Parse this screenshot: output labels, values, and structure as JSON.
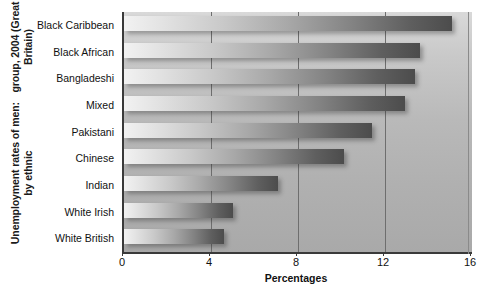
{
  "chart_data": {
    "type": "bar",
    "orientation": "horizontal",
    "title": "Unemployment rates of men: by ethnic group, 2004 (Great Britain)",
    "title_lines": [
      "Unemployment rates of men: by ethnic",
      "group, 2004 (Great Britain)"
    ],
    "xlabel": "Percentages",
    "ylabel": "",
    "categories": [
      "Black Caribbean",
      "Black African",
      "Bangladeshi",
      "Mixed",
      "Pakistani",
      "Chinese",
      "Indian",
      "White Irish",
      "White British"
    ],
    "values": [
      15.1,
      13.6,
      13.4,
      12.9,
      11.4,
      10.1,
      7.1,
      5.0,
      4.6
    ],
    "xlim": [
      0,
      16
    ],
    "xticks": [
      0,
      4,
      8,
      12,
      16
    ],
    "xtick_labels": [
      "0",
      "4",
      "8",
      "12",
      "16"
    ],
    "grid": "vertical",
    "legend": "none",
    "colors": {
      "bar_gradient_light": "#f2f2f2",
      "bar_gradient_dark": "#4c4c4c",
      "plot_background": "#b4b4b4",
      "axis": "#3a3a3a",
      "gridline": "#6e6e6e",
      "text": "#111111"
    }
  }
}
